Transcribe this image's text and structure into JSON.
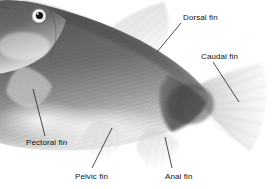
{
  "figure": {
    "name": "fish-external-anatomy",
    "background_color": "#ffffff",
    "width": 273,
    "height": 189,
    "body_color": "#7d7d7d",
    "body_dark_color": "#4f4f4f",
    "fin_color": "#d8d8d8",
    "label_color": "#111111",
    "leader_color": "#202020"
  },
  "labels": {
    "dorsal": {
      "text": "Dorsal fin",
      "x": 183,
      "y": 13,
      "leader": {
        "x1": 181,
        "y1": 23,
        "x2": 157,
        "y2": 52
      }
    },
    "caudal": {
      "text": "Caudal fin",
      "x": 201,
      "y": 52,
      "leader": {
        "x1": 213,
        "y1": 62,
        "x2": 239,
        "y2": 102
      }
    },
    "pectoral": {
      "text": "Pectoral fin",
      "x": 26,
      "y": 138,
      "leader": {
        "x1": 45,
        "y1": 136,
        "x2": 33,
        "y2": 89
      }
    },
    "pelvic": {
      "text": "Pelvic fin",
      "x": 75,
      "y": 172,
      "leader": {
        "x1": 92,
        "y1": 168,
        "x2": 112,
        "y2": 128
      }
    },
    "anal": {
      "text": "Anal fin",
      "x": 165,
      "y": 172,
      "leader": {
        "x1": 172,
        "y1": 168,
        "x2": 165,
        "y2": 137
      }
    }
  },
  "parts": {
    "eye": "fish-eye",
    "head": "fish-head",
    "body": "fish-body",
    "dorsal_fin": "dorsal-fin",
    "caudal_fin": "caudal-fin",
    "pectoral_fin": "pectoral-fin",
    "pelvic_fin": "pelvic-fin",
    "anal_fin": "anal-fin"
  }
}
